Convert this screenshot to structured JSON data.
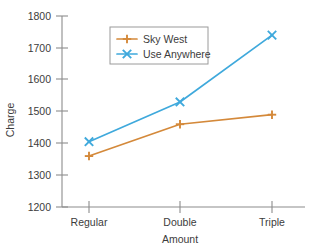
{
  "chart_data": {
    "type": "line",
    "title": "",
    "subtitle": "",
    "xlabel": "Amount",
    "ylabel": "Charge",
    "categories": [
      "Regular",
      "Double",
      "Triple"
    ],
    "series": [
      {
        "name": "Sky West",
        "color": "#d4893a",
        "marker": "plus",
        "values": [
          1360,
          1460,
          1490
        ]
      },
      {
        "name": "Use Anywhere",
        "color": "#3fa9dc",
        "marker": "x",
        "values": [
          1405,
          1530,
          1740
        ]
      }
    ],
    "ylim": [
      1200,
      1800
    ],
    "ytick_labels": [
      "1800",
      "1700",
      "1600",
      "1500",
      "1400",
      "1300",
      "1200"
    ],
    "ytick_values": [
      1800,
      1700,
      1600,
      1500,
      1400,
      1300,
      1200
    ],
    "ytick_step": 100,
    "grid": false,
    "legend_position": "upper-left-inside",
    "axis_color": "#8c8c8c",
    "text_color": "#3c3c3c",
    "background": "#ffffff"
  },
  "axes": {
    "y_title": "Charge",
    "x_title": "Amount",
    "y_ticks": [
      {
        "label": "1800"
      },
      {
        "label": "1700"
      },
      {
        "label": "1600"
      },
      {
        "label": "1500"
      },
      {
        "label": "1400"
      },
      {
        "label": "1300"
      },
      {
        "label": "1200"
      }
    ],
    "x_ticks": [
      {
        "label": "Regular"
      },
      {
        "label": "Double"
      },
      {
        "label": "Triple"
      }
    ]
  },
  "legend": {
    "entries": [
      {
        "label": "Sky West"
      },
      {
        "label": "Use Anywhere"
      }
    ]
  }
}
